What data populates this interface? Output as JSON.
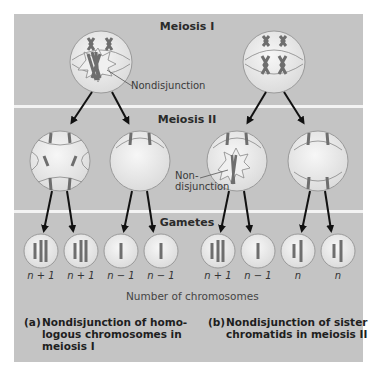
{
  "stages": {
    "meiosis1": "Meiosis I",
    "meiosis2": "Meiosis II",
    "gametes": "Gametes"
  },
  "annotations": {
    "nondisjunction_a": "Nondisjunction",
    "nondisjunction_b_line1": "Non-",
    "nondisjunction_b_line2": "disjunction"
  },
  "gametes": [
    {
      "label": "n + 1",
      "panel": "a"
    },
    {
      "label": "n + 1",
      "panel": "a"
    },
    {
      "label": "n − 1",
      "panel": "a"
    },
    {
      "label": "n − 1",
      "panel": "a"
    },
    {
      "label": "n + 1",
      "panel": "b"
    },
    {
      "label": "n − 1",
      "panel": "b"
    },
    {
      "label": "n",
      "panel": "b"
    },
    {
      "label": "n",
      "panel": "b"
    }
  ],
  "axis_label": "Number of chromosomes",
  "captions": {
    "a": {
      "prefix": "(a)",
      "line1": "Nondisjunction of homo-",
      "line2": "logous chromosomes in",
      "line3": "meiosis I"
    },
    "b": {
      "prefix": "(b)",
      "line1": "Nondisjunction of sister",
      "line2": "chromatids in meiosis II"
    }
  },
  "colors": {
    "panel_bg": "#c4c4c4",
    "cell_fill": "#ececec",
    "chromosome": "#6e6e6e",
    "arrow": "#111111"
  }
}
